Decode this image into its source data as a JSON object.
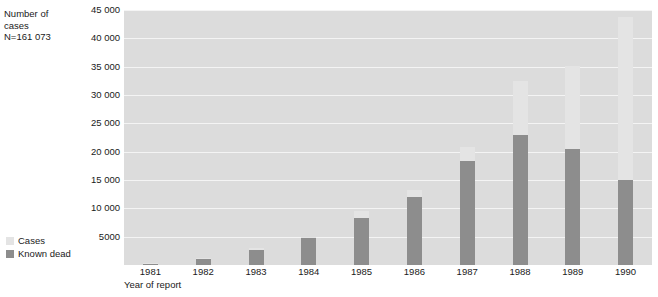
{
  "chart_data": {
    "type": "bar",
    "subtype": "overlaid-two-series",
    "title": "",
    "ylabel": "Number of cases\nN=161 073",
    "xlabel": "Year of report",
    "categories": [
      "1981",
      "1982",
      "1983",
      "1984",
      "1985",
      "1986",
      "1987",
      "1988",
      "1989",
      "1990"
    ],
    "series": [
      {
        "name": "Cases",
        "color": "#e4e4e4",
        "values": [
          300,
          1200,
          3000,
          5000,
          9500,
          13300,
          20900,
          32500,
          35200,
          43700
        ]
      },
      {
        "name": "Known dead",
        "color": "#8d8d8d",
        "values": [
          250,
          1000,
          2700,
          4700,
          8300,
          12000,
          18300,
          23000,
          20400,
          15000
        ]
      }
    ],
    "ylim": [
      0,
      45000
    ],
    "yticks": [
      45000,
      40000,
      35000,
      30000,
      25000,
      20000,
      15000,
      10000,
      5000
    ],
    "ytick_labels": [
      "45 000",
      "40 000",
      "35 000",
      "30 000",
      "25 000",
      "20 000",
      "15 000",
      "10 000",
      "5000"
    ],
    "grid": true,
    "grid_color": "#f4f4f4",
    "plot_background": "#dcdcdc",
    "legend_position": "bottom-left"
  },
  "axis_title": {
    "line1": "Number of",
    "line2": "cases",
    "line3": "N=161 073",
    "text": "Number of\ncases\nN=161 073"
  },
  "x_axis": {
    "title": "Year of report"
  },
  "legend": {
    "items": [
      {
        "label": "Cases",
        "color": "#e4e4e4"
      },
      {
        "label": "Known dead",
        "color": "#8d8d8d"
      }
    ]
  }
}
